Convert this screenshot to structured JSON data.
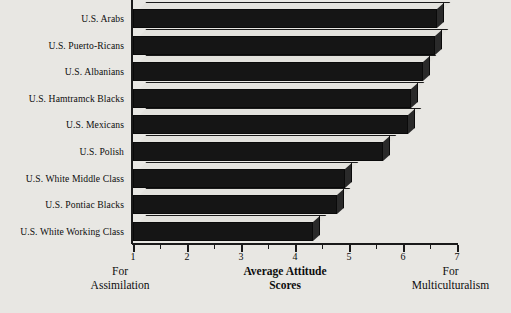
{
  "chart_data": {
    "type": "bar",
    "orientation": "horizontal",
    "title": "",
    "xlabel": "Average Attitude Scores",
    "ylabel": "",
    "xlim": [
      1,
      7
    ],
    "grid": false,
    "legend": null,
    "categories": [
      "U.S. Arabs",
      "U.S. Puerto-Ricans",
      "U.S. Albanians",
      "U.S. Hamtramck Blacks",
      "U.S. Mexicans",
      "U.S. Polish",
      "U.S. White Middle Class",
      "U.S. Pontiac Blacks",
      "U.S. White Working Class"
    ],
    "values": [
      6.63,
      6.59,
      6.37,
      6.15,
      6.09,
      5.63,
      4.93,
      4.78,
      4.33
    ],
    "xticks": [
      1,
      2,
      3,
      4,
      5,
      6,
      7
    ],
    "xticklabels": [
      "1",
      "2",
      "3",
      "4",
      "5",
      "6",
      "7"
    ],
    "minor_ticks": [
      1.5,
      2.5,
      3.5,
      4.5,
      5.5,
      6.5
    ],
    "annotations": {
      "left_anchor": [
        "For",
        "Assimilation"
      ],
      "center_title": [
        "Average Attitude",
        "Scores"
      ],
      "right_anchor": [
        "For",
        "Multiculturalism"
      ]
    },
    "colors": {
      "bar_front": "#151515",
      "bar_top": "#e3e2dd",
      "bar_side": "#2a2a2a",
      "axis": "#1a1a1a",
      "background": "#e8e7e3"
    }
  }
}
